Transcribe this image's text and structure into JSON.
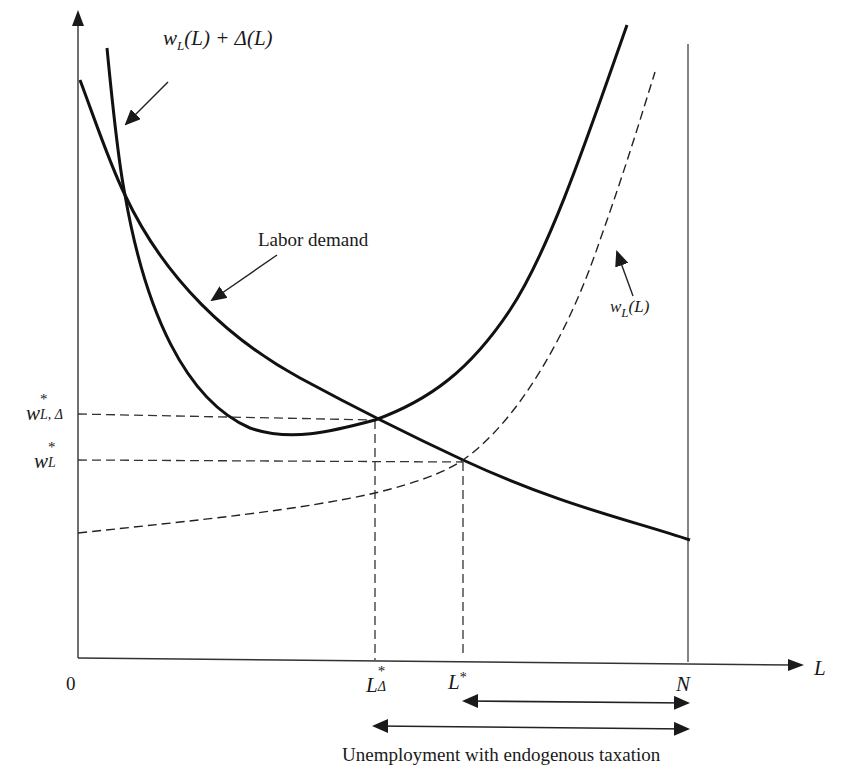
{
  "diagram": {
    "axes": {
      "x_label": "L",
      "origin_label": "0",
      "y_label": ""
    },
    "curves": {
      "labor_demand": {
        "label": "Labor demand",
        "style": "solid-thick"
      },
      "wage_plus_tax": {
        "label_main": "w",
        "label_sub": "L",
        "label_rest": "(L) + Δ(L)",
        "style": "solid-thick"
      },
      "wage": {
        "label_main": "w",
        "label_sub": "L",
        "label_rest": "(L)",
        "style": "dashed"
      }
    },
    "y_ticks": {
      "w_L_Delta": {
        "main": "w",
        "sup": "*",
        "sub": "L, Δ"
      },
      "w_L": {
        "main": "w",
        "sup": "*",
        "sub": "L"
      }
    },
    "x_ticks": {
      "L_Delta": {
        "main": "L",
        "sup": "*",
        "sub": "Δ"
      },
      "L_star": {
        "main": "L",
        "sup": "*"
      },
      "N": {
        "main": "N"
      }
    },
    "annotations": {
      "unemployment_caption": "Unemployment with endogenous taxation"
    },
    "colors": {
      "ink": "#1a1a1a",
      "guide": "#333333",
      "background": "#ffffff"
    }
  }
}
